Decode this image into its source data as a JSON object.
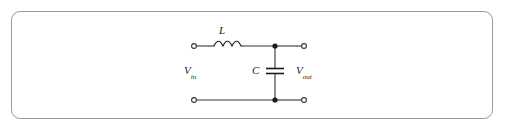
{
  "figure": {
    "kind": "schematic-diagram",
    "frame": {
      "border_color": "#9a9a9a",
      "background_color": "#ffffff",
      "corner_radius_px": 9
    },
    "ink_color": "#1a1a1a",
    "wire_color": "#333333"
  },
  "labels": {
    "inductor": "L",
    "capacitor": "C",
    "input_voltage": "V",
    "input_voltage_subscript": "in",
    "output_voltage": "V",
    "output_voltage_subscript": "out"
  },
  "components": {
    "inductor": {
      "name": "L",
      "symbol": "coil",
      "coil_bumps": 3,
      "orientation": "horizontal",
      "position": "top-branch-series"
    },
    "capacitor": {
      "name": "C",
      "symbol": "parallel-plates",
      "plates": 2,
      "orientation": "horizontal-plates",
      "position": "shunt-branch"
    }
  },
  "terminals": {
    "style": "open-circle",
    "count": 4,
    "items": [
      {
        "id": "input-top",
        "role": "input positive"
      },
      {
        "id": "input-bottom",
        "role": "input return"
      },
      {
        "id": "output-top",
        "role": "output positive"
      },
      {
        "id": "output-bottom",
        "role": "output return"
      }
    ]
  },
  "junctions": {
    "style": "filled-dot",
    "count": 2,
    "items": [
      {
        "id": "node-top",
        "role": "top shunt node"
      },
      {
        "id": "node-bottom",
        "role": "bottom shunt node"
      }
    ]
  }
}
